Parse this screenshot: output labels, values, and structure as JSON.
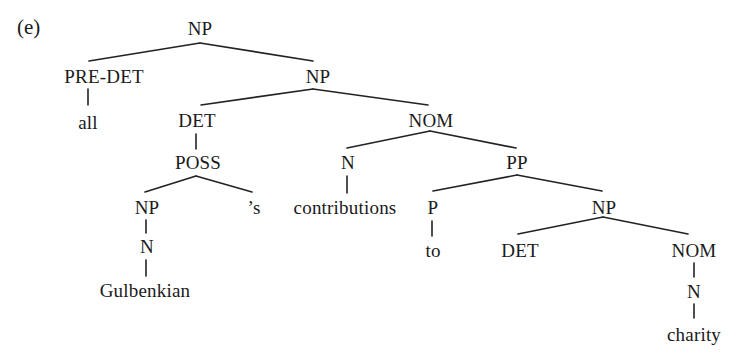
{
  "figure": {
    "example_label": "(e)",
    "type": "syntax-tree",
    "ink_color": "#1a1a1a",
    "background": "#ffffff"
  },
  "nodes": [
    {
      "id": "n0",
      "label": "NP",
      "x": 200,
      "y": 28
    },
    {
      "id": "n1",
      "label": "PRE-DET",
      "x": 104,
      "y": 76
    },
    {
      "id": "n2",
      "label": "NP",
      "x": 318,
      "y": 76
    },
    {
      "id": "n3",
      "label": "all",
      "x": 88,
      "y": 122
    },
    {
      "id": "n4",
      "label": "DET",
      "x": 197,
      "y": 120
    },
    {
      "id": "n5",
      "label": "NOM",
      "x": 431,
      "y": 120
    },
    {
      "id": "n6",
      "label": "POSS",
      "x": 198,
      "y": 162
    },
    {
      "id": "n7",
      "label": "N",
      "x": 348,
      "y": 162
    },
    {
      "id": "n8",
      "label": "PP",
      "x": 517,
      "y": 162
    },
    {
      "id": "n9",
      "label": "NP",
      "x": 147,
      "y": 207
    },
    {
      "id": "n10",
      "label": "’s",
      "x": 254,
      "y": 207
    },
    {
      "id": "n11",
      "label": "contributions",
      "x": 345,
      "y": 207
    },
    {
      "id": "n12",
      "label": "P",
      "x": 433,
      "y": 207
    },
    {
      "id": "n13",
      "label": "NP",
      "x": 604,
      "y": 207
    },
    {
      "id": "n14",
      "label": "N",
      "x": 147,
      "y": 246
    },
    {
      "id": "n15",
      "label": "to",
      "x": 433,
      "y": 250
    },
    {
      "id": "n16",
      "label": "DET",
      "x": 520,
      "y": 250
    },
    {
      "id": "n17",
      "label": "NOM",
      "x": 694,
      "y": 250
    },
    {
      "id": "n18",
      "label": "Gulbenkian",
      "x": 145,
      "y": 290
    },
    {
      "id": "n19",
      "label": "N",
      "x": 694,
      "y": 291
    },
    {
      "id": "n20",
      "label": "charity",
      "x": 694,
      "y": 334
    }
  ],
  "edges": [
    {
      "from": "n0",
      "to": "n1",
      "x1": 200,
      "y1": 43,
      "x2": 89,
      "y2": 61
    },
    {
      "from": "n0",
      "to": "n2",
      "x1": 200,
      "y1": 43,
      "x2": 313,
      "y2": 61
    },
    {
      "from": "n1",
      "to": "n3",
      "x1": 88,
      "y1": 89,
      "x2": 88,
      "y2": 105
    },
    {
      "from": "n2",
      "to": "n4",
      "x1": 313,
      "y1": 89,
      "x2": 201,
      "y2": 105
    },
    {
      "from": "n2",
      "to": "n5",
      "x1": 313,
      "y1": 89,
      "x2": 428,
      "y2": 105
    },
    {
      "from": "n4",
      "to": "n6",
      "x1": 196,
      "y1": 134,
      "x2": 196,
      "y2": 149
    },
    {
      "from": "n5",
      "to": "n7",
      "x1": 430,
      "y1": 131,
      "x2": 347,
      "y2": 148
    },
    {
      "from": "n5",
      "to": "n8",
      "x1": 430,
      "y1": 131,
      "x2": 516,
      "y2": 148
    },
    {
      "from": "n6",
      "to": "n9",
      "x1": 196,
      "y1": 176,
      "x2": 145,
      "y2": 192
    },
    {
      "from": "n6",
      "to": "n10",
      "x1": 196,
      "y1": 176,
      "x2": 252,
      "y2": 192
    },
    {
      "from": "n7",
      "to": "n11",
      "x1": 347,
      "y1": 176,
      "x2": 347,
      "y2": 193
    },
    {
      "from": "n8",
      "to": "n12",
      "x1": 517,
      "y1": 175,
      "x2": 433,
      "y2": 191
    },
    {
      "from": "n8",
      "to": "n13",
      "x1": 517,
      "y1": 175,
      "x2": 602,
      "y2": 191
    },
    {
      "from": "n9",
      "to": "n14",
      "x1": 146,
      "y1": 220,
      "x2": 146,
      "y2": 233
    },
    {
      "from": "n12",
      "to": "n15",
      "x1": 432,
      "y1": 221,
      "x2": 432,
      "y2": 236
    },
    {
      "from": "n13",
      "to": "n16",
      "x1": 603,
      "y1": 217,
      "x2": 518,
      "y2": 234
    },
    {
      "from": "n13",
      "to": "n17",
      "x1": 603,
      "y1": 217,
      "x2": 688,
      "y2": 234
    },
    {
      "from": "n14",
      "to": "n18",
      "x1": 146,
      "y1": 260,
      "x2": 146,
      "y2": 276
    },
    {
      "from": "n17",
      "to": "n19",
      "x1": 694,
      "y1": 263,
      "x2": 694,
      "y2": 277
    },
    {
      "from": "n19",
      "to": "n20",
      "x1": 694,
      "y1": 304,
      "x2": 694,
      "y2": 318
    }
  ]
}
